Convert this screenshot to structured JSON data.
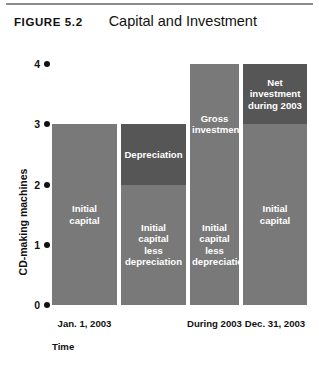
{
  "figure": {
    "number": "FIGURE 5.2",
    "title": "Capital and Investment"
  },
  "chart_data": {
    "type": "bar",
    "title": "Capital and Investment",
    "xlabel": "Time",
    "ylabel": "CD-making machines",
    "ylim": [
      0,
      4
    ],
    "yticks": [
      "0",
      "1",
      "2",
      "3",
      "4"
    ],
    "grid": false,
    "legend": "none",
    "stacked": true,
    "categories": [
      "Jan. 1, 2003",
      "During 2003",
      "Dec. 31, 2003"
    ],
    "bars": [
      {
        "category": "Jan. 1, 2003",
        "total": 3,
        "segments": [
          {
            "label": "Initial\ncapital",
            "from": 0,
            "to": 3,
            "value": 3,
            "shade": "mid"
          }
        ]
      },
      {
        "category": "Jan. 1, 2003",
        "total": 3,
        "segments": [
          {
            "label": "Initial\ncapital\nless\ndepreciation",
            "from": 0,
            "to": 2,
            "value": 2,
            "shade": "mid"
          },
          {
            "label": "Depreciation",
            "from": 2,
            "to": 3,
            "value": 1,
            "shade": "dark"
          }
        ]
      },
      {
        "category": "During 2003",
        "total": 4,
        "segments": [
          {
            "label": "Initial\ncapital\nless\ndepreciation",
            "from": 0,
            "to": 2,
            "value": 2,
            "shade": "mid"
          },
          {
            "label": "Gross\ninvestment",
            "from": 2,
            "to": 4,
            "value": 2,
            "shade": "mid"
          }
        ]
      },
      {
        "category": "Dec. 31, 2003",
        "total": 4,
        "segments": [
          {
            "label": "Initial\ncapital",
            "from": 0,
            "to": 3,
            "value": 3,
            "shade": "mid"
          },
          {
            "label": "Net\ninvestment\nduring 2003",
            "from": 3,
            "to": 4,
            "value": 1,
            "shade": "dark"
          }
        ]
      }
    ],
    "xtick_labels": [
      {
        "text": "Jan. 1, 2003",
        "center_bar": 0
      },
      {
        "text": "During 2003",
        "center_bar": 2
      },
      {
        "text": "Dec. 31, 2003",
        "center_bar": 3
      }
    ],
    "colors": {
      "mid": "#797979",
      "dark": "#565656",
      "text_on_bar": "#ffffff",
      "axis_text": "#111111",
      "background": "#ffffff"
    }
  }
}
